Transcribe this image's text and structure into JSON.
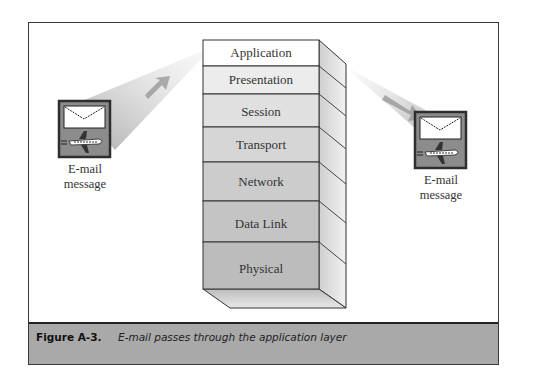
{
  "figure": {
    "label": "Figure A-3.",
    "caption": "E-mail passes through the application layer"
  },
  "stack": {
    "layers": [
      {
        "name": "Application"
      },
      {
        "name": "Presentation"
      },
      {
        "name": "Session"
      },
      {
        "name": "Transport"
      },
      {
        "name": "Network"
      },
      {
        "name": "Data Link"
      },
      {
        "name": "Physical"
      }
    ]
  },
  "left_icon": {
    "icon": "email-airplane-icon",
    "label_line1": "E-mail",
    "label_line2": "message"
  },
  "right_icon": {
    "icon": "email-airplane-icon",
    "label_line1": "E-mail",
    "label_line2": "message"
  },
  "colors": {
    "caption_bar": "#a9a9a9",
    "icon_frame": "#2e2e2e",
    "icon_bg": "#8c8c8c",
    "beam": "#c8c8c8"
  }
}
